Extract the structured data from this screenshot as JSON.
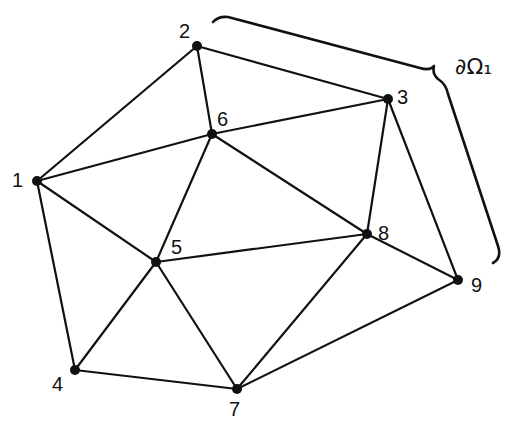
{
  "diagram": {
    "type": "triangulated mesh",
    "nodes": [
      {
        "id": "1",
        "x": 37,
        "y": 181,
        "lx": 12,
        "ly": 187
      },
      {
        "id": "2",
        "x": 197,
        "y": 46,
        "lx": 179,
        "ly": 38
      },
      {
        "id": "3",
        "x": 388,
        "y": 99,
        "lx": 397,
        "ly": 104
      },
      {
        "id": "4",
        "x": 75,
        "y": 370,
        "lx": 52,
        "ly": 391
      },
      {
        "id": "5",
        "x": 156,
        "y": 262,
        "lx": 171,
        "ly": 254
      },
      {
        "id": "6",
        "x": 212,
        "y": 134,
        "lx": 217,
        "ly": 126
      },
      {
        "id": "7",
        "x": 237,
        "y": 389,
        "lx": 229,
        "ly": 416
      },
      {
        "id": "8",
        "x": 367,
        "y": 234,
        "lx": 378,
        "ly": 240
      },
      {
        "id": "9",
        "x": 458,
        "y": 280,
        "lx": 471,
        "ly": 292
      }
    ],
    "edges": [
      [
        "1",
        "2"
      ],
      [
        "1",
        "6"
      ],
      [
        "1",
        "5"
      ],
      [
        "1",
        "4"
      ],
      [
        "2",
        "6"
      ],
      [
        "2",
        "3"
      ],
      [
        "3",
        "6"
      ],
      [
        "3",
        "8"
      ],
      [
        "3",
        "9"
      ],
      [
        "6",
        "5"
      ],
      [
        "6",
        "8"
      ],
      [
        "5",
        "8"
      ],
      [
        "5",
        "4"
      ],
      [
        "5",
        "7"
      ],
      [
        "8",
        "7"
      ],
      [
        "8",
        "9"
      ],
      [
        "4",
        "7"
      ],
      [
        "7",
        "9"
      ]
    ],
    "boundary_label": "∂Ω₁",
    "boundary_nodes": [
      "2",
      "3",
      "9"
    ]
  }
}
